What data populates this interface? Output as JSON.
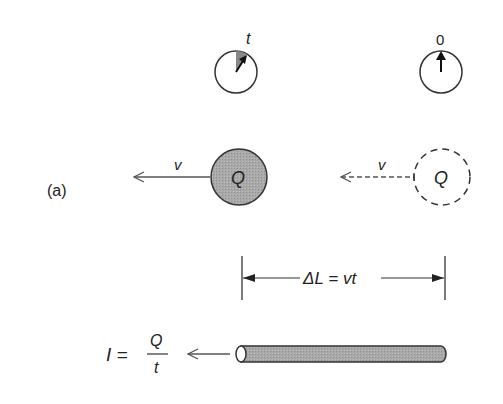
{
  "panel_label": "(a)",
  "clock_left": {
    "label": "t"
  },
  "clock_right": {
    "label": "0"
  },
  "charge_moving": {
    "label": "Q",
    "velocity_label": "v"
  },
  "charge_initial": {
    "label": "Q",
    "velocity_label": "v"
  },
  "length_dimension": {
    "label": "ΔL = vt"
  },
  "current_formula": {
    "lhs": "I =",
    "numerator": "Q",
    "denominator": "t"
  },
  "colors": {
    "line": "#333333",
    "fill_gray": "#a8a8a8",
    "sector_gray": "#888888"
  }
}
